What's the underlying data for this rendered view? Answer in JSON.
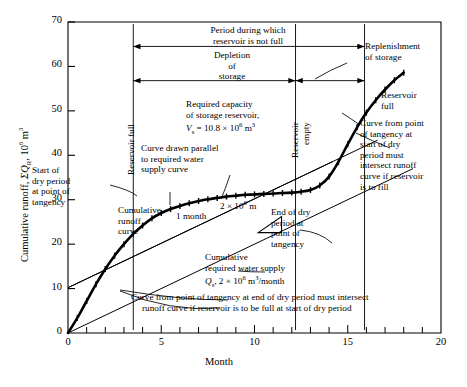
{
  "chart_data": {
    "type": "line",
    "title": "",
    "xlabel": "Month",
    "ylabel": "Cumulative runoff, ΣQ_R, 10⁶ m³",
    "xlim": [
      0,
      20
    ],
    "ylim": [
      0,
      70
    ],
    "xticks": [
      0,
      5,
      10,
      15,
      20
    ],
    "xtick_labels": [
      "0",
      "5",
      "10",
      "15",
      "20"
    ],
    "xminor_step": 1,
    "yticks": [
      0,
      10,
      20,
      30,
      40,
      50,
      60,
      70
    ],
    "ytick_labels": [
      "0",
      "10",
      "20",
      "30",
      "40",
      "50",
      "60",
      "70"
    ],
    "grid": false,
    "legend": "none",
    "series": [
      {
        "name": "Cumulative runoff curve",
        "type": "line",
        "marker": "plus",
        "x": [
          0,
          0.5,
          1,
          1.5,
          2,
          2.5,
          3,
          3.5,
          4,
          4.5,
          5,
          5.5,
          6,
          6.5,
          7,
          7.5,
          8,
          8.5,
          9,
          9.5,
          10,
          10.5,
          11,
          11.5,
          12,
          12.5,
          13,
          13.5,
          14,
          14.5,
          15,
          15.5,
          16,
          16.5,
          17,
          17.5,
          18
        ],
        "y": [
          0,
          3.4,
          7.2,
          11.0,
          14.4,
          17.4,
          20.0,
          22.3,
          24.2,
          25.8,
          27.0,
          27.9,
          28.6,
          29.2,
          29.7,
          30.1,
          30.4,
          30.7,
          30.9,
          31.1,
          31.2,
          31.3,
          31.4,
          31.5,
          31.6,
          31.8,
          32.2,
          33.2,
          35.2,
          38.5,
          42.5,
          46.3,
          49.6,
          52.4,
          54.8,
          56.9,
          58.6
        ]
      },
      {
        "name": "Cumulative required water supply",
        "type": "line",
        "marker": "none",
        "slope_per_month": 2.0,
        "x": [
          0,
          18.5
        ],
        "y": [
          0,
          37.0
        ]
      },
      {
        "name": "Tangent at start of dry period (parallel to required supply)",
        "type": "line",
        "marker": "none",
        "x": [
          0,
          16.6
        ],
        "y": [
          10.2,
          43.4
        ]
      },
      {
        "name": "Tangent at end of dry period (parallel to required supply)",
        "type": "line",
        "marker": "none",
        "x": [
          0,
          14.2
        ],
        "y": [
          10.2,
          38.6
        ]
      }
    ],
    "reference_lines": [
      {
        "name": "reservoir-full-start",
        "x": 3.5,
        "label": "Reservoir full"
      },
      {
        "name": "reservoir-empty",
        "x": 12.2,
        "label": "Reservoir empty"
      },
      {
        "name": "reservoir-full-end",
        "x": 15.9,
        "label": "Reservoir full"
      }
    ],
    "spans": [
      {
        "name": "period-reservoir-not-full",
        "from": 3.5,
        "to": 15.9,
        "y": 64.5,
        "label": "Period during which reservoir is not full"
      },
      {
        "name": "depletion-of-storage",
        "from": 3.5,
        "to": 12.2,
        "y": 56.8,
        "label": "Depletion of storage"
      },
      {
        "name": "replenishment-of-storage",
        "from": 12.2,
        "to": 15.9,
        "y": 56.8,
        "label": "Replenishment of storage"
      }
    ],
    "slope_triangle": {
      "name": "slope-triangle",
      "rise_label": "2 × 10⁶ m³",
      "run_label": "1 month"
    }
  },
  "annotations": {
    "period_not_full": "Period during which\nreservoir is not full",
    "period_not_full_l1": "Period during which",
    "period_not_full_l2": "reservoir is not full",
    "depletion_l1": "Depletion",
    "depletion_l2": "of",
    "depletion_l3": "storage",
    "replenishment_l1": "Replenishment",
    "replenishment_l2": "of storage",
    "required_capacity_l1": "Required capacity",
    "required_capacity_l2": "of storage reservoir,",
    "required_capacity_l3_pre": "V",
    "required_capacity_l3_sub": "s",
    "required_capacity_l3_post": " = 10.8 × 10",
    "required_capacity_l3_exp": "6",
    "required_capacity_l3_tail": " m",
    "required_capacity_l3_exp2": "3",
    "curve_parallel_l1": "Curve drawn parallel",
    "curve_parallel_l2": "to required water",
    "curve_parallel_l3": "supply curve",
    "reservoir_full_left": "Reservoir full",
    "reservoir_empty": "Reservoir empty",
    "reservoir_full_right_l1": "Reservoir",
    "reservoir_full_right_l2": "full",
    "start_dry_l1": "Start of",
    "start_dry_l2": "dry period",
    "start_dry_l3": "at point of",
    "start_dry_l4": "tangency",
    "cumulative_runoff_l1": "Cumulative",
    "cumulative_runoff_l2": "runoff",
    "cumulative_runoff_l3": "curve",
    "end_dry_l1": "End of dry",
    "end_dry_l2": "period at",
    "end_dry_l3": "point of",
    "end_dry_l4": "tangency",
    "curve_from_start_l1": "Curve from point",
    "curve_from_start_l2": "of tangency at",
    "curve_from_start_l3": "start of dry",
    "curve_from_start_l4": "period must",
    "curve_from_start_l5": "intersect runoff",
    "curve_from_start_l6": "curve if reservoir",
    "curve_from_start_l7": "is to fill",
    "cumulative_supply_l1": "Cumulative",
    "cumulative_supply_l2": "required water supply",
    "cumulative_supply_l3_pre": "Q",
    "cumulative_supply_l3_sub": "s",
    "cumulative_supply_l3_post": ", 2 × 10",
    "cumulative_supply_l3_exp": "6",
    "cumulative_supply_l3_tail": " m",
    "cumulative_supply_l3_exp2": "3",
    "cumulative_supply_l3_end": "/month",
    "bottom_note_l1": "Curve from point of tangency at end of dry period must intersect",
    "bottom_note_l2": "runoff curve if reservoir is to be full at start of dry period",
    "triangle_rise_pre": "2 × 10",
    "triangle_rise_exp": "6",
    "triangle_rise_tail": " m",
    "triangle_run": "1 month"
  },
  "axes": {
    "x_label": "Month",
    "y_label_pre": "Cumulative runoff, ",
    "y_label_sym": "ΣQ",
    "y_label_sub": "R",
    "y_label_post": ", 10",
    "y_label_exp": "6",
    "y_label_tail": " m",
    "y_label_exp2": "3",
    "x_tick_labels": [
      "0",
      "5",
      "10",
      "15",
      "20"
    ],
    "y_tick_labels": [
      "0",
      "10",
      "20",
      "30",
      "40",
      "50",
      "60",
      "70"
    ]
  },
  "colors": {
    "ink": "#000000",
    "background": "#ffffff",
    "curve": "#000000"
  }
}
